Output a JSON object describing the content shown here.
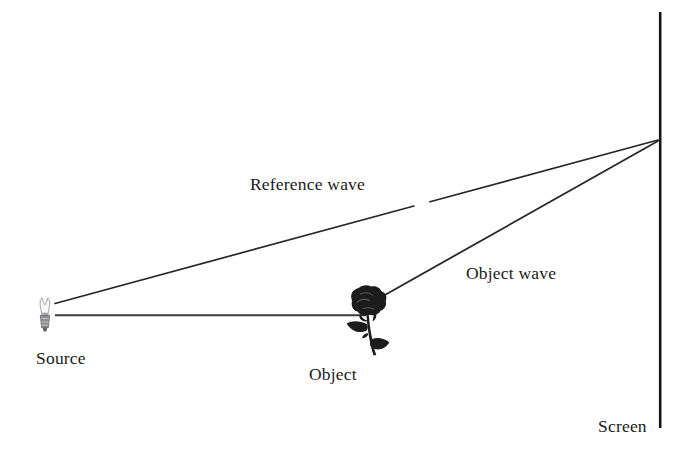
{
  "figure": {
    "type": "optics-diagram",
    "background_color": "#ffffff",
    "ink_color": "#1b1b1b"
  },
  "labels": {
    "source": "Source",
    "object": "Object",
    "screen": "Screen",
    "reference_wave": "Reference wave",
    "object_wave": "Object wave"
  },
  "elements": {
    "light_source": {
      "name": "light-bulb",
      "x": 47,
      "y": 318
    },
    "object": {
      "name": "rose",
      "x": 370,
      "y": 318
    },
    "screen": {
      "name": "vertical-screen-line",
      "x": 660,
      "y_top": 12,
      "y_bottom": 428
    },
    "convergence_point": {
      "x": 659,
      "y": 140
    }
  },
  "rays": [
    {
      "name": "reference-wave-ray",
      "from": [
        55,
        303
      ],
      "to": [
        658,
        140
      ],
      "label": "Reference wave"
    },
    {
      "name": "illumination-ray",
      "from": [
        55,
        315
      ],
      "to": [
        365,
        315
      ],
      "label": ""
    },
    {
      "name": "object-wave-ray",
      "from": [
        376,
        300
      ],
      "to": [
        658,
        141
      ],
      "label": "Object wave"
    }
  ]
}
